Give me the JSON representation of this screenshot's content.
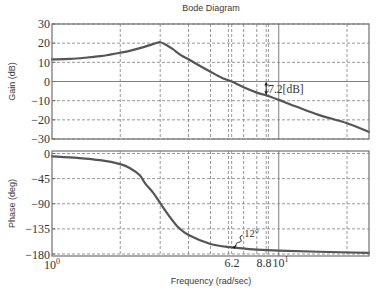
{
  "figure": {
    "title": "Bode Diagram",
    "xlabel": "Frequency (rad/sec)"
  },
  "gain_panel": {
    "ylabel": "Gain (dB)",
    "ytick_labels": [
      "30",
      "20",
      "10",
      "0",
      "−10",
      "−20",
      "−30"
    ],
    "annotation_label": "7.2[dB]"
  },
  "phase_panel": {
    "ylabel": "Phase (deg)",
    "ytick_labels": [
      "0",
      "−45",
      "−90",
      "−135",
      "−180"
    ],
    "annotation_label": "12°"
  },
  "xtick_labels": [
    {
      "base": "10",
      "exp": "0"
    },
    {
      "text": "6.2"
    },
    {
      "text": "8.8"
    },
    {
      "base": "10",
      "exp": "1"
    }
  ],
  "colors": {
    "background": "#ffffff",
    "curve": "#555555",
    "grid": "#8c8c8c",
    "frame": "#707070",
    "text": "#3a3a3a",
    "annotation": "#222222"
  },
  "chart_data": [
    {
      "type": "line",
      "title": "Bode Diagram",
      "panel": "Gain",
      "xlabel": "Frequency (rad/sec)",
      "ylabel": "Gain (dB)",
      "xscale": "log",
      "xlim": [
        1,
        25
      ],
      "ylim": [
        -30,
        30
      ],
      "yticks": [
        30,
        20,
        10,
        0,
        -10,
        -20,
        -30
      ],
      "grid": true,
      "grid_x": [
        2,
        3,
        4,
        5,
        6,
        6.2,
        7,
        8,
        8.8,
        9,
        10,
        20
      ],
      "solid_grid_x": [
        10
      ],
      "solid_grid_y": [
        0
      ],
      "series": [
        {
          "name": "Gain",
          "x": [
            1,
            1.2,
            1.4,
            1.63,
            1.8,
            2,
            2.2,
            2.44,
            2.7,
            2.9,
            3,
            3.15,
            3.4,
            3.7,
            4,
            4.5,
            5,
            5.6,
            6.2,
            7,
            8,
            8.8,
            10,
            12,
            15,
            20,
            25
          ],
          "y": [
            11.5,
            11.8,
            12.4,
            13.2,
            14,
            15,
            16,
            17.4,
            19,
            20.2,
            20.5,
            19.4,
            17,
            13.8,
            11.6,
            8.1,
            5.1,
            2,
            0,
            -3,
            -5.8,
            -7.2,
            -9.6,
            -13.2,
            -17.4,
            -21.8,
            -26.3
          ]
        }
      ],
      "annotations": [
        {
          "text": "7.2[dB]",
          "kind": "gain-margin-arrow",
          "x": 8.8,
          "y1": 0,
          "y2": -7.2
        }
      ]
    },
    {
      "type": "line",
      "panel": "Phase",
      "xlabel": "Frequency (rad/sec)",
      "ylabel": "Phase (deg)",
      "xscale": "log",
      "xlim": [
        1,
        25
      ],
      "ylim": [
        -180,
        0
      ],
      "yticks": [
        0,
        -45,
        -90,
        -135,
        -180
      ],
      "xticks": [
        1,
        6.2,
        8.8,
        10
      ],
      "xtick_labels": [
        "10^0",
        "6.2",
        "8.8",
        "10^1"
      ],
      "grid": true,
      "grid_x": [
        2,
        3,
        4,
        5,
        6,
        6.2,
        7,
        8,
        8.8,
        9,
        10,
        20
      ],
      "solid_grid_x": [
        10
      ],
      "solid_grid_y": [],
      "series": [
        {
          "name": "Phase",
          "x": [
            1,
            1.3,
            1.63,
            2,
            2.2,
            2.44,
            2.57,
            2.8,
            3,
            3.3,
            3.6,
            4,
            5,
            6.2,
            8,
            10,
            15,
            25
          ],
          "y": [
            -5,
            -8,
            -12,
            -19,
            -26,
            -39,
            -53,
            -71,
            -89,
            -113,
            -132,
            -146,
            -162,
            -168,
            -172,
            -174,
            -176,
            -178
          ]
        }
      ],
      "annotations": [
        {
          "text": "12°",
          "kind": "phase-margin-callout",
          "x": 6.2,
          "y": -168
        }
      ]
    }
  ]
}
